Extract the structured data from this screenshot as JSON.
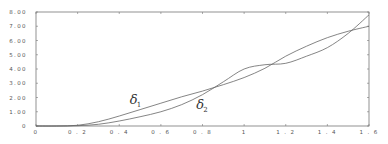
{
  "chart_data": {
    "type": "line",
    "title": "",
    "xlabel": "",
    "ylabel": "",
    "xlim": [
      0,
      1.6
    ],
    "ylim": [
      0,
      8
    ],
    "grid": false,
    "legend": "none (inline curve labels)",
    "x_ticks": [
      "0",
      "0.2",
      "0.4",
      "0.6",
      "0.8",
      "1",
      "1.2",
      "1.4",
      "1.6"
    ],
    "y_ticks": [
      "0",
      "1.00",
      "2.00",
      "3.00",
      "4.00",
      "5.00",
      "6.00",
      "7.00",
      "8.00"
    ],
    "x": [
      0,
      0.1,
      0.2,
      0.3,
      0.4,
      0.5,
      0.6,
      0.7,
      0.8,
      0.9,
      1.0,
      1.1,
      1.2,
      1.3,
      1.4,
      1.5,
      1.6
    ],
    "series": [
      {
        "name": "δ1",
        "label_main": "δ",
        "label_sub": "1",
        "label_pos": [
          0.45,
          1.55
        ],
        "values": [
          0,
          0,
          0.05,
          0.3,
          0.7,
          1.15,
          1.6,
          2.05,
          2.45,
          2.9,
          3.4,
          4.05,
          4.9,
          5.6,
          6.2,
          6.65,
          7.0
        ]
      },
      {
        "name": "δ2",
        "label_main": "δ",
        "label_sub": "2",
        "label_pos": [
          0.77,
          1.2
        ],
        "values": [
          0,
          0,
          0.02,
          0.12,
          0.35,
          0.65,
          1.0,
          1.5,
          2.2,
          3.1,
          4.0,
          4.3,
          4.4,
          4.9,
          5.5,
          6.5,
          7.8
        ]
      }
    ]
  }
}
